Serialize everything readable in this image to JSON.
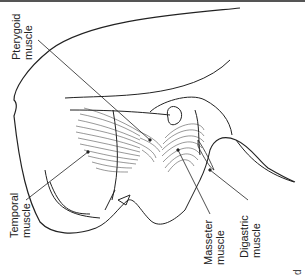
{
  "figure": {
    "labels": [
      {
        "id": "pterygoid",
        "line1": "Pterygoid",
        "line2": "muscle"
      },
      {
        "id": "temporal",
        "line1": "Temporal",
        "line2": "muscle"
      },
      {
        "id": "masseter",
        "line1": "Masseter",
        "line2": "muscle"
      },
      {
        "id": "digastric",
        "line1": "Digastric",
        "line2": "muscle"
      }
    ],
    "panel_letter": "d"
  }
}
